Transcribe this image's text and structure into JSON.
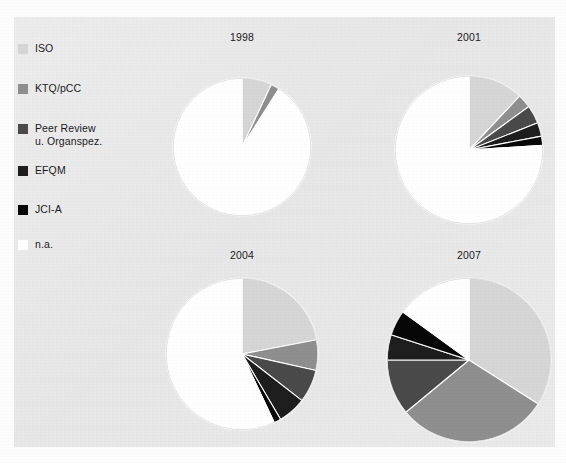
{
  "figure": {
    "background_color": "#e9e9e9",
    "page_color": "#fdfdfd"
  },
  "legend": {
    "items": [
      {
        "label": "ISO",
        "color": "#d6d6d6"
      },
      {
        "label": "KTQ/pCC",
        "color": "#8f8f8f"
      },
      {
        "label": "Peer Review\nu. Organspez.",
        "color": "#4a4a4a"
      },
      {
        "label": "EFQM",
        "color": "#1e1e1e"
      },
      {
        "label": "JCI-A",
        "color": "#080808"
      },
      {
        "label": "n.a.",
        "color": "#ffffff"
      }
    ]
  },
  "chart_data": [
    {
      "type": "pie",
      "title": "1998",
      "labels": [
        "ISO",
        "KTQ/pCC",
        "Peer Review u. Organspez.",
        "EFQM",
        "JCI-A",
        "n.a."
      ],
      "colors": [
        "#d6d6d6",
        "#8f8f8f",
        "#4a4a4a",
        "#1e1e1e",
        "#080808",
        "#ffffff"
      ],
      "values": [
        7.0,
        2.0,
        0.0,
        0.0,
        0.0,
        91.0
      ],
      "start_angle": 0,
      "direction": "clockwise",
      "units": "percent"
    },
    {
      "type": "pie",
      "title": "2001",
      "labels": [
        "ISO",
        "KTQ/pCC",
        "Peer Review u. Organspez.",
        "EFQM",
        "JCI-A",
        "n.a."
      ],
      "colors": [
        "#d6d6d6",
        "#8f8f8f",
        "#4a4a4a",
        "#1e1e1e",
        "#080808",
        "#ffffff"
      ],
      "values": [
        12.0,
        3.0,
        4.0,
        3.0,
        2.0,
        76.0
      ],
      "start_angle": 0,
      "direction": "clockwise",
      "units": "percent"
    },
    {
      "type": "pie",
      "title": "2004",
      "labels": [
        "ISO",
        "KTQ/pCC",
        "Peer Review u. Organspez.",
        "EFQM",
        "JCI-A",
        "n.a."
      ],
      "colors": [
        "#d6d6d6",
        "#8f8f8f",
        "#4a4a4a",
        "#1e1e1e",
        "#080808",
        "#ffffff"
      ],
      "values": [
        22.0,
        6.5,
        7.0,
        6.0,
        1.5,
        57.0
      ],
      "start_angle": 0,
      "direction": "clockwise",
      "units": "percent"
    },
    {
      "type": "pie",
      "title": "2007",
      "labels": [
        "ISO",
        "KTQ/pCC",
        "Peer Review u. Organspez.",
        "EFQM",
        "JCI-A",
        "n.a."
      ],
      "colors": [
        "#d6d6d6",
        "#8f8f8f",
        "#4a4a4a",
        "#1e1e1e",
        "#080808",
        "#ffffff"
      ],
      "values": [
        34.0,
        30.0,
        11.0,
        5.0,
        5.0,
        15.0
      ],
      "start_angle": 0,
      "direction": "clockwise",
      "units": "percent"
    }
  ],
  "layout": {
    "panels": [
      {
        "left": 128,
        "top": 14,
        "width": 200,
        "height": 214,
        "radius": 69,
        "cy": 115
      },
      {
        "left": 355,
        "top": 14,
        "width": 200,
        "height": 214,
        "radius": 74,
        "cy": 118
      },
      {
        "left": 128,
        "top": 232,
        "width": 200,
        "height": 200,
        "radius": 76,
        "cy": 104
      },
      {
        "left": 355,
        "top": 232,
        "width": 200,
        "height": 200,
        "radius": 82,
        "cy": 110
      }
    ]
  }
}
